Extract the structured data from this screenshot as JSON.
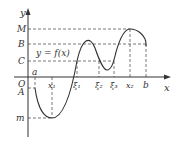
{
  "diagram": {
    "function_label": "y = f(x)",
    "axes": {
      "x_label": "x",
      "y_label": "y",
      "origin_label": "O"
    },
    "y_levels": [
      {
        "label": "M",
        "y": 29
      },
      {
        "label": "B",
        "y": 44
      },
      {
        "label": "C",
        "y": 61
      },
      {
        "label": "A",
        "y": 88
      },
      {
        "label": "m",
        "y": 118
      }
    ],
    "x_points": [
      {
        "label": "a",
        "x": 35
      },
      {
        "label": "x₁",
        "x": 52
      },
      {
        "label": "ξ₁",
        "x": 77
      },
      {
        "label": "ξ₂",
        "x": 99
      },
      {
        "label": "ξ₃",
        "x": 114
      },
      {
        "label": "x₂",
        "x": 130
      },
      {
        "label": "b",
        "x": 146
      }
    ],
    "colors": {
      "line": "#333333",
      "dashed": "#555555"
    }
  }
}
